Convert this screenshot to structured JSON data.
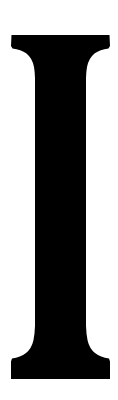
{
  "image": {
    "type": "glyph-image",
    "width": 118,
    "height": 400,
    "background_color": "#ffffff",
    "foreground_color": "#000000",
    "description": "Large black serif capital letter I on a white background"
  },
  "glyph": {
    "character": "I",
    "name": "latin-capital-letter-i",
    "style": "serif",
    "weight": "bold",
    "color": "#000000",
    "geometry": {
      "top_serif": {
        "top_y": 35,
        "left_x": 14,
        "right_x": 110,
        "slab_bottom_y": 48,
        "bracket_end_y": 72
      },
      "stem": {
        "left_x": 36,
        "right_x": 86,
        "width": 50,
        "top_y": 48,
        "bottom_y": 340
      },
      "bottom_serif": {
        "bracket_start_y": 340,
        "foot_top_y": 362,
        "bottom_y": 379,
        "left_x": 11,
        "right_x": 110
      }
    }
  }
}
